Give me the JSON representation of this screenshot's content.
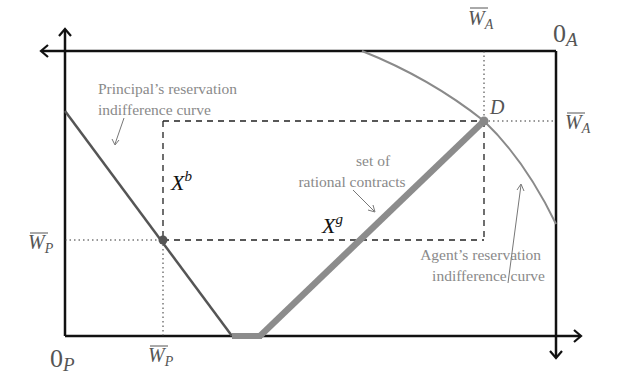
{
  "diagram": {
    "type": "edgeworth_box",
    "origins": {
      "principal": {
        "main": "0",
        "sub": "P"
      },
      "agent": {
        "main": "0",
        "sub": "A"
      }
    },
    "tick_labels": {
      "wp_left": {
        "main": "W",
        "sub": "P"
      },
      "wp_bottom": {
        "main": "W",
        "sub": "P"
      },
      "wa_top": {
        "main": "W",
        "sub": "A"
      },
      "wa_right": {
        "main": "W",
        "sub": "A"
      }
    },
    "point_labels": {
      "d": "D",
      "xb": {
        "main": "X",
        "sup": "b"
      },
      "xg": {
        "main": "X",
        "sup": "g"
      }
    },
    "annotations": {
      "principal_curve": [
        "Principal’s reservation",
        "indifference curve"
      ],
      "agent_curve": [
        "Agent’s reservation",
        "indifference curve"
      ],
      "rational_set": [
        "set of",
        "rational contracts"
      ]
    },
    "colors": {
      "axis": "#111111",
      "principal_curve": "#555555",
      "agent_curve": "#8a8a8a",
      "rational_set": "#8c8c8c",
      "annotation_text": "#8a8a8a",
      "dashed": "#222222"
    }
  }
}
